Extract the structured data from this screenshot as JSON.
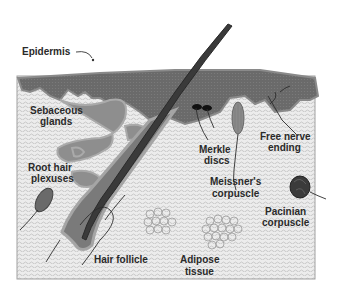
{
  "diagram": {
    "colors": {
      "background": "#ffffff",
      "dermis_fill": "#e6e6e6",
      "dermis_hatch": "#b8b8b8",
      "epidermis_fill": "#6e6e6e",
      "epidermis_light": "#9a9a9a",
      "hair_shaft": "#3a3a3a",
      "border": "#9a9a9a",
      "text": "#2a2a2a",
      "lines": "#333333"
    },
    "labels": {
      "epidermis": "Epidermis",
      "sebaceous_1": "Sebaceous",
      "sebaceous_2": "glands",
      "merkle_1": "Merkle",
      "merkle_2": "discs",
      "free_nerve_1": "Free nerve",
      "free_nerve_2": "ending",
      "meissner_1": "Meissner's",
      "meissner_2": "corpuscle",
      "root_hair_1": "Root hair",
      "root_hair_2": "plexuses",
      "pacinian_1": "Pacinian",
      "pacinian_2": "corpuscle",
      "hair_follicle": "Hair follicle",
      "adipose_1": "Adipose",
      "adipose_2": "tissue"
    }
  }
}
